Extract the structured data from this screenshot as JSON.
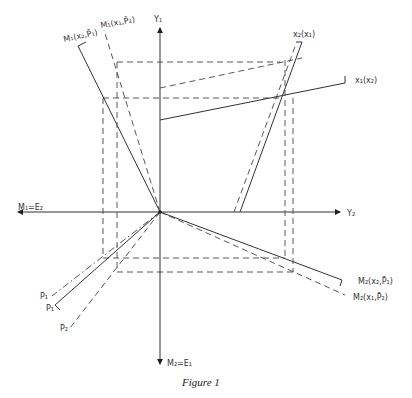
{
  "figure": {
    "caption": "Figure 1",
    "labels": {
      "y1_axis": "Y₁",
      "y2_axis": "Y₂",
      "m1_x2_p1": "M₁(x₂,P̄₁)",
      "m1_x1_p2": "M₁(x₁,P̄₂)",
      "x2_of_x1": "x₂(x₁)",
      "x1_of_x2": "x₁(x₂)",
      "m1_e2": "M₁=E₂",
      "m2_e1": "M₂=E₁",
      "m2_x2_p1": "M₂(x₂,P̄₁)",
      "m2_x1_p2": "M₂(x₁,P̄₂)",
      "p1_a": "P₁",
      "p1_b": "P₁",
      "p2": "P₂"
    },
    "origin": {
      "x": 160,
      "y": 212
    },
    "colors": {
      "ink": "#333333",
      "background": "#ffffff"
    }
  }
}
